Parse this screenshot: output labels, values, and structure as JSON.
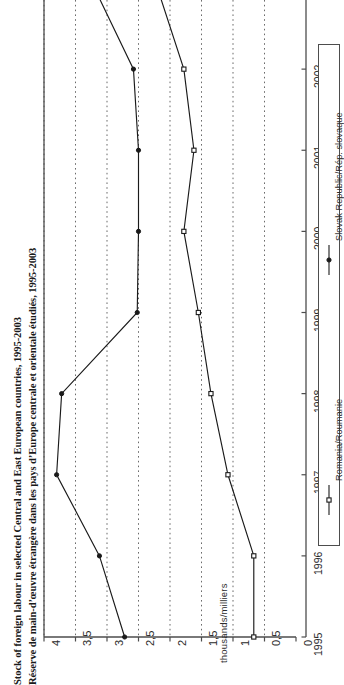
{
  "titles": {
    "english": "Stock of foreign labour in selected Central and East European countries, 1995-2003",
    "french": "Réserve de main-d’œuvre étrangère dans les pays d’Europe centrale et orientale étudiés, 1995-2003"
  },
  "axes": {
    "value_axis_label": "thousands/milliers",
    "value_ticks": [
      "0",
      "0,5",
      "1",
      "1,5",
      "2",
      "2,5",
      "3",
      "3,5",
      "4"
    ],
    "year_ticks": [
      "1995",
      "1996",
      "1997",
      "1998",
      "1999",
      "2000",
      "2001",
      "2002"
    ]
  },
  "legend": {
    "entries": [
      {
        "label": "Romania/Roumanie",
        "marker": "filled-square-marker",
        "color": "#1a1a1a"
      },
      {
        "label": "Slovak Republic/Rép. slovaque",
        "marker": "filled-circle-marker",
        "color": "#1a1a1a"
      }
    ]
  },
  "colors": {
    "line": "#1a1a1a",
    "gridline": "#6b6b6b",
    "axis": "#4d4d4d",
    "background": "#ffffff"
  },
  "chart_data": {
    "type": "line",
    "title": "Stock of foreign labour in selected Central and East European countries, 1995-2003",
    "subtitle": "Réserve de main-d’œuvre étrangère dans les pays d’Europe centrale et orientale étudiés, 1995-2003",
    "orientation": "rotated-90-ccw",
    "xlabel": "",
    "ylabel": "thousands/milliers",
    "x": [
      1995,
      1996,
      1997,
      1998,
      1999,
      2000,
      2001,
      2002,
      2003
    ],
    "xlim": [
      1995,
      2003
    ],
    "ylim": [
      0,
      4
    ],
    "yticks": [
      0,
      0.5,
      1,
      1.5,
      2,
      2.5,
      3,
      3.5,
      4
    ],
    "grid": true,
    "legend_position": "right",
    "series": [
      {
        "name": "Romania/Roumanie",
        "values": [
          0.67,
          0.67,
          1.08,
          1.35,
          1.55,
          1.78,
          1.62,
          1.78,
          2.2
        ]
      },
      {
        "name": "Slovak Republic/Rép. slovaque",
        "values": [
          2.72,
          3.12,
          3.8,
          3.72,
          2.52,
          2.5,
          2.5,
          2.58,
          3.2
        ]
      }
    ]
  }
}
